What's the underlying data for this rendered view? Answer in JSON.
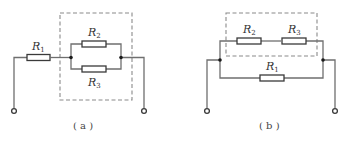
{
  "diagrams": [
    {
      "id": "a",
      "caption": "( a )",
      "resistors": [
        {
          "name": "R",
          "sub": "1"
        },
        {
          "name": "R",
          "sub": "2"
        },
        {
          "name": "R",
          "sub": "3"
        }
      ],
      "description": "R1 in series with parallel combination of R2 and R3 (boxed)"
    },
    {
      "id": "b",
      "caption": "( b )",
      "resistors": [
        {
          "name": "R",
          "sub": "2"
        },
        {
          "name": "R",
          "sub": "3"
        },
        {
          "name": "R",
          "sub": "1"
        }
      ],
      "description": "Series R2-R3 (boxed) in parallel with R1"
    }
  ],
  "colors": {
    "wire": "#6f6f6f",
    "resistor": "#3a3a3a",
    "dashed_box": "#8a8a8a",
    "node": "#1a1a1a"
  }
}
